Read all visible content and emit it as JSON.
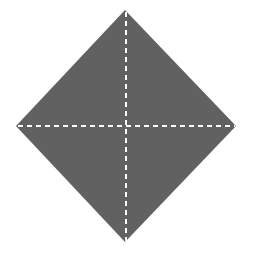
{
  "canvas": {
    "width": 253,
    "height": 253,
    "background_color": "#ffffff",
    "title": "Diamond with dashed symmetry cross"
  },
  "chart_data": {
    "type": "diagram",
    "title": "",
    "subtitle": "",
    "shapes": [
      {
        "id": "diamond",
        "name": "diamond",
        "kind": "polygon",
        "fill": "#616161",
        "stroke": "none",
        "vertices": [
          {
            "label": "top",
            "x": 125,
            "y": 10
          },
          {
            "label": "right",
            "x": 236,
            "y": 126
          },
          {
            "label": "bottom",
            "x": 125,
            "y": 242
          },
          {
            "label": "left",
            "x": 16,
            "y": 126
          }
        ],
        "center": {
          "x": 126,
          "y": 126
        },
        "width": 220,
        "height": 232,
        "rotation_degrees": 45
      },
      {
        "id": "fold-line-vertical",
        "name": "vertical-dashed-fold-line",
        "kind": "line",
        "stroke": "#ffffff",
        "stroke_width": 2,
        "dash_length": 5,
        "gap_length": 4,
        "x1": 126,
        "y1": 12,
        "x2": 126,
        "y2": 241
      },
      {
        "id": "fold-line-horizontal",
        "name": "horizontal-dashed-fold-line",
        "kind": "line",
        "stroke": "#ffffff",
        "stroke_width": 2,
        "dash_length": 5,
        "gap_length": 4,
        "x1": 18,
        "y1": 126,
        "x2": 235,
        "y2": 126
      }
    ],
    "colors": {
      "shape_fill": "#616161",
      "dash_stroke": "#ffffff",
      "background": "#ffffff"
    },
    "legend": [],
    "annotations": [],
    "labels": []
  }
}
